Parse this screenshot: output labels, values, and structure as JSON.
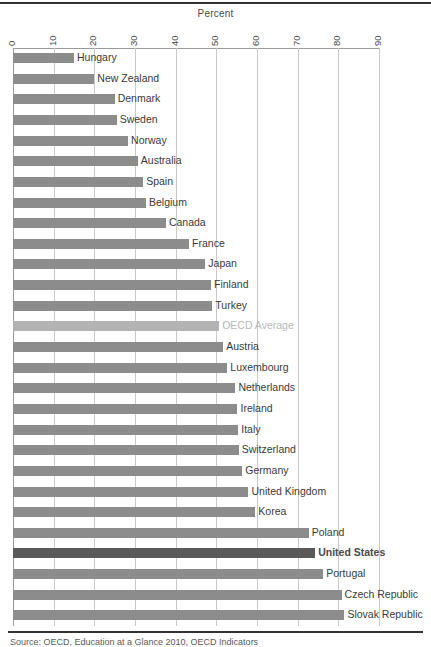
{
  "chart_data": {
    "type": "bar",
    "orientation": "horizontal",
    "title": "",
    "xlabel": "Percent",
    "ylabel": "",
    "xlim": [
      0,
      90
    ],
    "xticks": [
      0,
      10,
      20,
      30,
      40,
      50,
      60,
      70,
      80,
      90
    ],
    "grid": true,
    "legend": "none",
    "bar_color": "#8c8c8c",
    "highlight_color": "#595959",
    "muted_color": "#b3b3b3",
    "categories": [
      "Hungary",
      "New Zealand",
      "Denmark",
      "Sweden",
      "Norway",
      "Australia",
      "Spain",
      "Belgium",
      "Canada",
      "France",
      "Japan",
      "Finland",
      "Turkey",
      "OECD Average",
      "Austria",
      "Luxembourg",
      "Netherlands",
      "Ireland",
      "Italy",
      "Switzerland",
      "Germany",
      "United Kingdom",
      "Korea",
      "Poland",
      "United States",
      "Portugal",
      "Czech Republic",
      "Slovak Republic"
    ],
    "values": [
      15,
      20,
      25,
      25.5,
      28.3,
      30.7,
      32,
      32.7,
      37.6,
      43.3,
      47.3,
      48.7,
      49,
      50.7,
      51.7,
      52.7,
      54.7,
      55.2,
      55.4,
      55.5,
      56.4,
      57.9,
      59.6,
      72.7,
      74.3,
      76.3,
      80.8,
      81.5
    ],
    "styles": [
      "normal",
      "normal",
      "normal",
      "normal",
      "normal",
      "normal",
      "normal",
      "normal",
      "normal",
      "normal",
      "normal",
      "normal",
      "normal",
      "muted",
      "normal",
      "normal",
      "normal",
      "normal",
      "normal",
      "normal",
      "normal",
      "normal",
      "normal",
      "normal",
      "highlight",
      "normal",
      "normal",
      "normal"
    ]
  },
  "axis": {
    "title": "Percent",
    "tick_labels": [
      "0",
      "10",
      "20",
      "30",
      "40",
      "50",
      "60",
      "70",
      "80",
      "90"
    ]
  },
  "footer": {
    "source": "Source: OECD, Education at a Glance 2010, OECD Indicators"
  }
}
